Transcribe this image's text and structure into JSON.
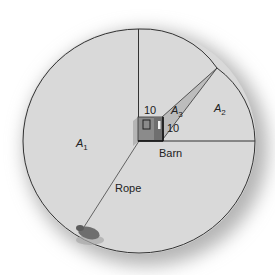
{
  "diagram": {
    "type": "geometry-area-diagram",
    "labels": {
      "area1": "A",
      "area1_sub": "1",
      "area2": "A",
      "area2_sub": "2",
      "area3": "A",
      "area3_sub": "3",
      "barn": "Barn",
      "rope": "Rope",
      "barn_side_top": "10",
      "barn_side_right": "10"
    },
    "colors": {
      "disk_fill": "#d9d9d9",
      "shadow": "#b8b8b8",
      "line": "#333333",
      "triangle_fill": "#bdbdbd",
      "barn_front": "#8a8a8a",
      "barn_side": "#6e6e6e",
      "background": "#ffffff"
    }
  }
}
